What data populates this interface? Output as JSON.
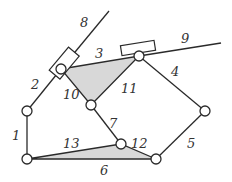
{
  "diagram": {
    "type": "planar-linkage-mechanism",
    "colors": {
      "stroke": "#2a2a2a",
      "fill_shaded": "#d8d8d8",
      "label": "#333333",
      "background": "#ffffff"
    },
    "labels": {
      "l1": "1",
      "l2": "2",
      "l3": "3",
      "l4": "4",
      "l5": "5",
      "l6": "6",
      "l7": "7",
      "l8": "8",
      "l9": "9",
      "l10": "10",
      "l11": "11",
      "l12": "12",
      "l13": "13"
    },
    "joints": [
      {
        "id": "A",
        "x": 61,
        "y": 69
      },
      {
        "id": "B",
        "x": 139,
        "y": 56
      },
      {
        "id": "C",
        "x": 91,
        "y": 105
      },
      {
        "id": "D",
        "x": 27,
        "y": 111
      },
      {
        "id": "E",
        "x": 27,
        "y": 159
      },
      {
        "id": "F",
        "x": 121,
        "y": 144
      },
      {
        "id": "G",
        "x": 156,
        "y": 159
      },
      {
        "id": "H",
        "x": 205,
        "y": 111
      }
    ]
  }
}
